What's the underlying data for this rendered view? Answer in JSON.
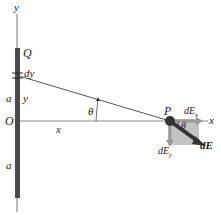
{
  "diagram": {
    "type": "physics-figure",
    "labels": {
      "y_axis": "y",
      "x_axis": "x",
      "charge": "Q",
      "element": "dy",
      "upper_a": "a",
      "y_coord": "y",
      "origin": "O",
      "x_dist": "x",
      "theta_left": "θ",
      "point": "P",
      "dEx": "dE",
      "dEx_sub": "x",
      "theta_right": "θ",
      "dEy": "dE",
      "dEy_sub": "y",
      "dE": "dE",
      "lower_a": "a"
    },
    "colors": {
      "rod": "#4a4a4a",
      "line": "#555555",
      "shade": "#b0b0b0",
      "vector": "#333333"
    }
  }
}
